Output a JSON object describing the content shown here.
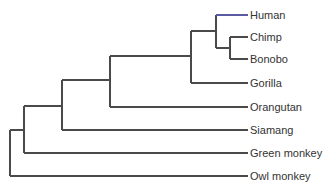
{
  "diagram": {
    "type": "phylogenetic-tree",
    "orientation": "left-to-right",
    "line_color": "#4a4a4a",
    "highlight_color": "#5a5aa0",
    "text_color": "#333333",
    "leaves": [
      {
        "label": "Human",
        "y": 15,
        "highlight": true
      },
      {
        "label": "Chimp",
        "y": 37
      },
      {
        "label": "Bonobo",
        "y": 59
      },
      {
        "label": "Gorilla",
        "y": 83
      },
      {
        "label": "Orangutan",
        "y": 107
      },
      {
        "label": "Siamang",
        "y": 130
      },
      {
        "label": "Green monkey",
        "y": 153
      },
      {
        "label": "Owl monkey",
        "y": 176
      }
    ],
    "leaf_x": 248,
    "label_x": 250,
    "clades": [
      {
        "name": "root",
        "x": 10,
        "y_top": 130,
        "y_bottom": 176,
        "children": [
          "anthropoid-ancestor",
          "Owl monkey"
        ]
      },
      {
        "name": "anthropoid-ancestor",
        "x": 24,
        "y_top": 106,
        "y_bottom": 153,
        "children": [
          "ape-ancestor",
          "Green monkey"
        ]
      },
      {
        "name": "ape-ancestor",
        "x": 62,
        "y_top": 80,
        "y_bottom": 130,
        "children": [
          "great-ape-ancestor",
          "Siamang"
        ]
      },
      {
        "name": "great-ape-ancestor",
        "x": 110,
        "y_top": 56,
        "y_bottom": 107,
        "children": [
          "african-ape-ancestor",
          "Orangutan"
        ]
      },
      {
        "name": "african-ape-ancestor",
        "x": 191,
        "y_top": 31,
        "y_bottom": 83,
        "children": [
          "human-chimp-ancestor",
          "Gorilla"
        ]
      },
      {
        "name": "human-chimp-ancestor",
        "x": 216,
        "y_top": 15,
        "y_bottom": 48,
        "children": [
          "Human",
          "pan-ancestor"
        ]
      },
      {
        "name": "pan-ancestor",
        "x": 230,
        "y_top": 37,
        "y_bottom": 59,
        "children": [
          "Chimp",
          "Bonobo"
        ]
      }
    ]
  }
}
